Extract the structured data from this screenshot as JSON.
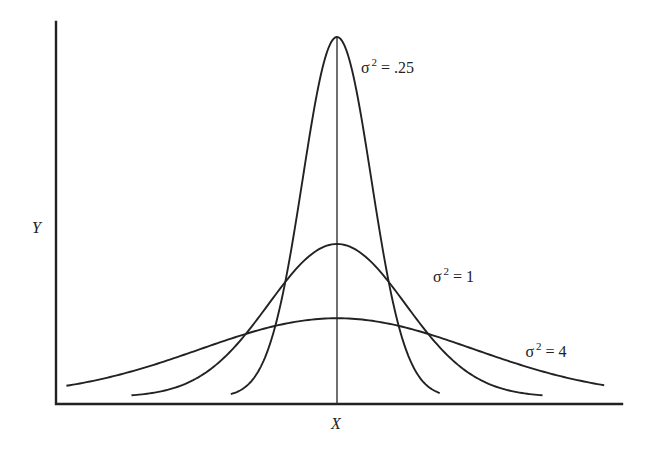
{
  "chart_data": {
    "type": "line",
    "title": "",
    "xlabel": "X",
    "ylabel": "Y",
    "xlim": [
      -4.2,
      4.2
    ],
    "ylim": [
      0,
      0.82
    ],
    "grid": false,
    "center_line_x": 0,
    "series": [
      {
        "name": "variance-0.25",
        "variance": 0.25,
        "mean": 0,
        "x_range": [
          -1.55,
          1.5
        ],
        "peak_y": 0.8,
        "label_symbol": "σ",
        "label_exponent": "2",
        "label_text": " = .25",
        "label_anchor_x": 0.35,
        "label_anchor_y": 0.72
      },
      {
        "name": "variance-1",
        "variance": 1,
        "mean": 0,
        "x_range": [
          -3.0,
          3.0
        ],
        "peak_y": 0.34,
        "label_symbol": "σ",
        "label_exponent": "2",
        "label_text": " = 1",
        "label_anchor_x": 1.4,
        "label_anchor_y": 0.255
      },
      {
        "name": "variance-4",
        "variance": 4,
        "mean": 0,
        "x_range": [
          -3.95,
          3.9
        ],
        "peak_y": 0.175,
        "label_symbol": "σ",
        "label_exponent": "2",
        "label_text": " = 4",
        "label_anchor_x": 2.75,
        "label_anchor_y": 0.09
      }
    ]
  }
}
